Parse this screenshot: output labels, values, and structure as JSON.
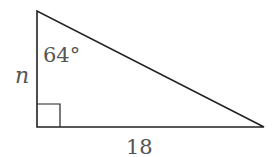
{
  "diagram": {
    "type": "right-triangle",
    "angle_label": "64°",
    "side_vertical_label": "n",
    "side_horizontal_label": "18",
    "right_angle_marker": true,
    "colors": {
      "stroke": "#222222",
      "text": "#555555"
    }
  }
}
